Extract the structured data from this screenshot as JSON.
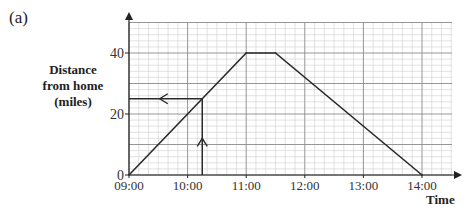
{
  "part_label": "(a)",
  "chart_data": {
    "type": "line",
    "title": "",
    "xlabel": "Time",
    "ylabel": "Distance from home (miles)",
    "ylabel_lines": [
      "Distance",
      "from home",
      "(miles)"
    ],
    "x_ticks": [
      "09:00",
      "10:00",
      "11:00",
      "12:00",
      "13:00",
      "14:00"
    ],
    "x_tick_hours": [
      9,
      10,
      11,
      12,
      13,
      14
    ],
    "y_ticks": [
      "0",
      "20",
      "40"
    ],
    "y_tick_values": [
      0,
      20,
      40
    ],
    "xlim_hours": [
      9,
      15
    ],
    "ylim": [
      0,
      50
    ],
    "grid": true,
    "grid_minor_x_per_hour": 6,
    "grid_minor_y_per_10": 5,
    "series": [
      {
        "name": "Journey",
        "x_hours": [
          9,
          11,
          11.5,
          14
        ],
        "x_labels": [
          "09:00",
          "11:00",
          "11:30",
          "14:00"
        ],
        "y": [
          0,
          40,
          40,
          0
        ]
      }
    ],
    "annotations": [
      {
        "type": "arrow-up",
        "description": "vertical reading line from time axis",
        "x_hours": 10.25,
        "x_label": "10:15",
        "from_y": 0,
        "to_y": 25
      },
      {
        "type": "arrow-left",
        "description": "horizontal reading line to distance axis",
        "y": 25,
        "from_x_hours": 10.25,
        "to_x_hours": 9
      }
    ],
    "colors": {
      "line": "#2a2a2a",
      "grid_major": "#8a8a8a",
      "grid_minor": "#cfcfcf",
      "axis": "#222222"
    }
  }
}
